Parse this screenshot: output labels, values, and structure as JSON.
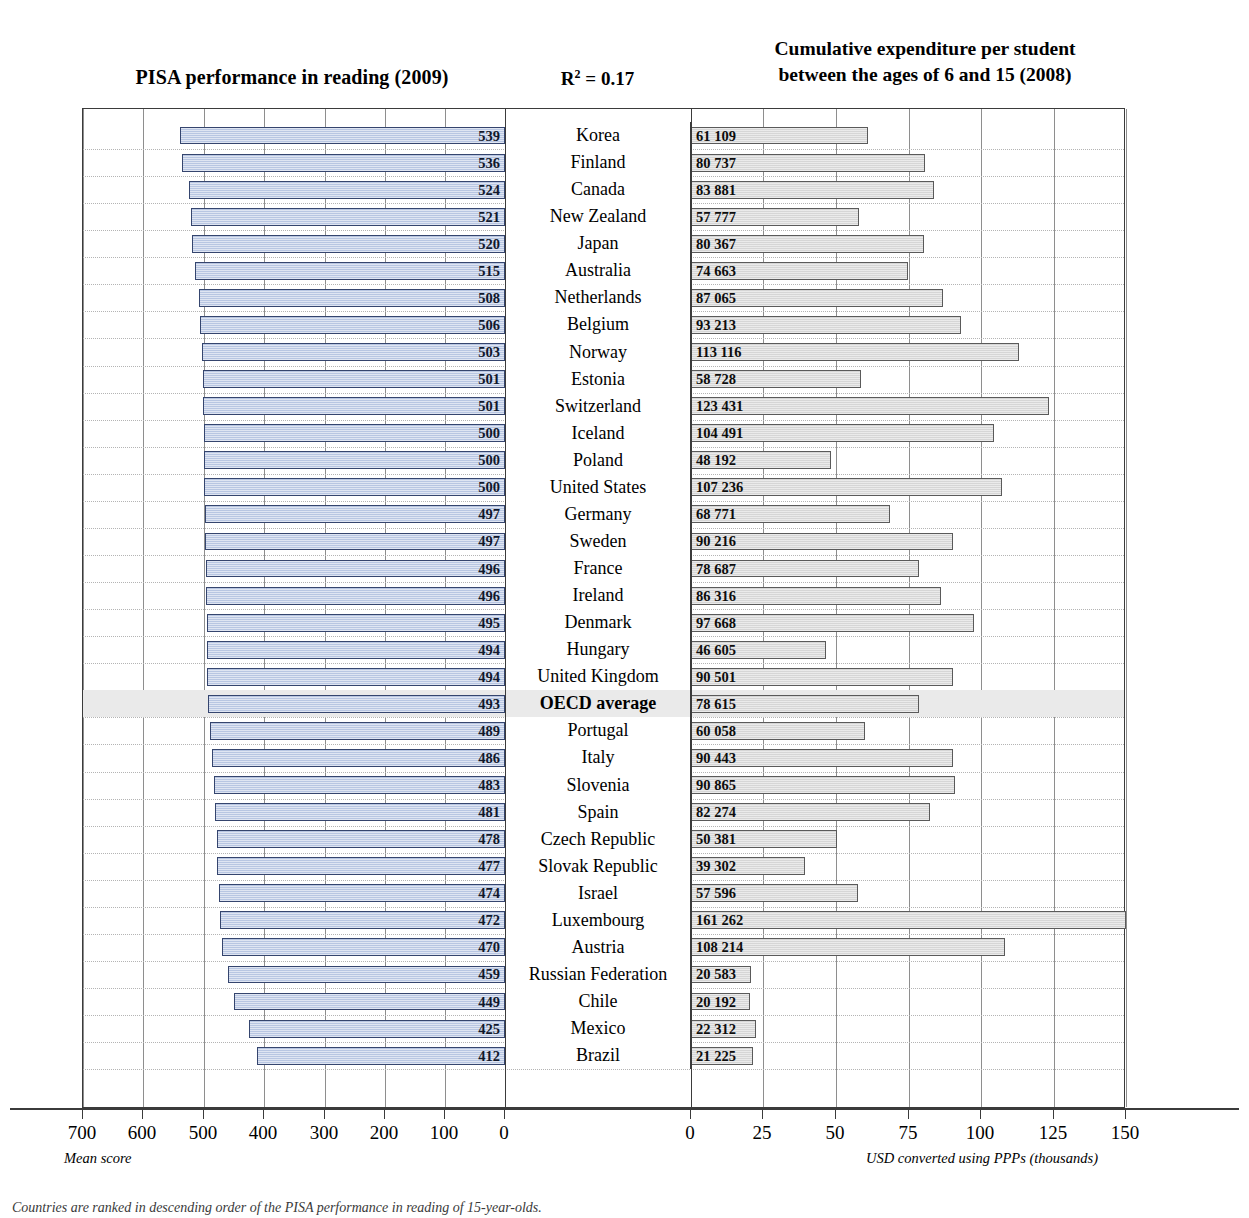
{
  "titles": {
    "left": "PISA performance in  reading (2009)",
    "r2_prefix": "R",
    "r2_sup": "2",
    "r2_suffix": " = 0.17",
    "r2_full": "R² = 0.17",
    "right_line1": "Cumulative expenditure per student",
    "right_line2": "between the ages of 6 and 15 (2008)"
  },
  "axes": {
    "left": {
      "caption": "Mean score",
      "ticks": [
        "700",
        "600",
        "500",
        "400",
        "300",
        "200",
        "100",
        "0"
      ],
      "min": 0,
      "max": 700,
      "reversed": true
    },
    "right": {
      "caption": "USD converted using PPPs (thousands)",
      "ticks": [
        "0",
        "25",
        "50",
        "75",
        "100",
        "125",
        "150"
      ],
      "min": 0,
      "max": 150
    }
  },
  "footnote": "Countries are ranked in descending order of the PISA performance in reading of 15-year-olds.",
  "chart_data": {
    "type": "bar",
    "layout": "diverging-bidirectional",
    "annotation": "R² = 0.17",
    "grid": true,
    "legend": null,
    "categories": [
      "Korea",
      "Finland",
      "Canada",
      "New Zealand",
      "Japan",
      "Australia",
      "Netherlands",
      "Belgium",
      "Norway",
      "Estonia",
      "Switzerland",
      "Iceland",
      "Poland",
      "United States",
      "Germany",
      "Sweden",
      "France",
      "Ireland",
      "Denmark",
      "Hungary",
      "United Kingdom",
      "OECD average",
      "Portugal",
      "Italy",
      "Slovenia",
      "Spain",
      "Czech Republic",
      "Slovak Republic",
      "Israel",
      "Luxembourg",
      "Austria",
      "Russian Federation",
      "Chile",
      "Mexico",
      "Brazil"
    ],
    "series": [
      {
        "name": "PISA performance in reading (2009)",
        "axis": "left",
        "unit": "Mean score",
        "color": "#b8c6e2",
        "values": [
          539,
          536,
          524,
          521,
          520,
          515,
          508,
          506,
          503,
          501,
          501,
          500,
          500,
          500,
          497,
          497,
          496,
          496,
          495,
          494,
          494,
          493,
          489,
          486,
          483,
          481,
          478,
          477,
          474,
          472,
          470,
          459,
          449,
          425,
          412
        ]
      },
      {
        "name": "Cumulative expenditure per student between the ages of 6 and 15 (2008)",
        "axis": "right",
        "unit": "USD converted using PPPs",
        "color": "#d6d6d6",
        "values": [
          61109,
          80737,
          83881,
          57777,
          80367,
          74663,
          87065,
          93213,
          113116,
          58728,
          123431,
          104491,
          48192,
          107236,
          68771,
          90216,
          78687,
          86316,
          97668,
          46605,
          90501,
          78615,
          60058,
          90443,
          90865,
          82274,
          50381,
          39302,
          57596,
          161262,
          108214,
          20583,
          20192,
          22312,
          21225
        ],
        "labels": [
          "61 109",
          "80 737",
          "83 881",
          "57 777",
          "80 367",
          "74 663",
          "87 065",
          "93 213",
          "113 116",
          "58 728",
          "123 431",
          "104 491",
          "48 192",
          "107 236",
          "68 771",
          "90 216",
          "78 687",
          "86 316",
          "97 668",
          "46 605",
          "90 501",
          "78 615",
          "60 058",
          "90 443",
          "90 865",
          "82 274",
          "50 381",
          "39 302",
          "57 596",
          "161 262",
          "108 214",
          "20 583",
          "20 192",
          "22 312",
          "21 225"
        ]
      }
    ],
    "highlight_row": "OECD average",
    "ylabel": "",
    "xlabel_left": "Mean score",
    "xlabel_right": "USD converted using PPPs (thousands)"
  }
}
